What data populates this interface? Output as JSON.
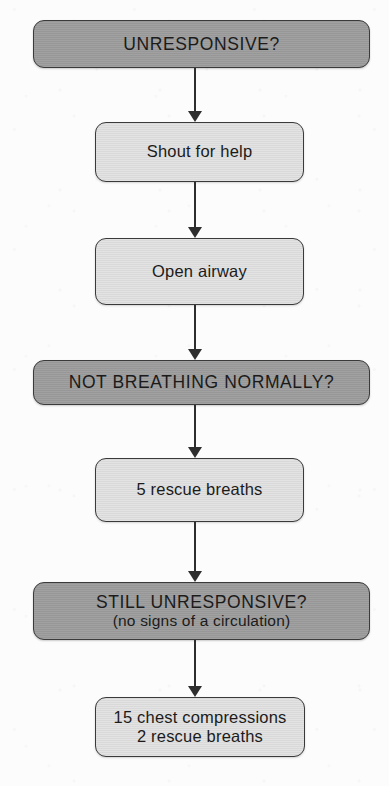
{
  "diagram": {
    "colors": {
      "page_background": "#fcfcfc",
      "dark_node_fill": "#9c9c9c",
      "light_node_fill": "#dddddd",
      "node_border": "#3a3a3a",
      "arrow": "#2e2e2e",
      "text": "#1b1b1b"
    },
    "nodes": [
      {
        "id": "unresponsive",
        "style": "dark",
        "text_style": "caps",
        "line_1": "UNRESPONSIVE?",
        "line_2": ""
      },
      {
        "id": "shout-for-help",
        "style": "light",
        "text_style": "body",
        "line_1": "Shout for help",
        "line_2": ""
      },
      {
        "id": "open-airway",
        "style": "light",
        "text_style": "body",
        "line_1": "Open airway",
        "line_2": ""
      },
      {
        "id": "not-breathing-normally",
        "style": "dark",
        "text_style": "caps",
        "line_1": "NOT BREATHING NORMALLY?",
        "line_2": ""
      },
      {
        "id": "five-rescue-breaths",
        "style": "light",
        "text_style": "body",
        "line_1": "5 rescue breaths",
        "line_2": ""
      },
      {
        "id": "still-unresponsive",
        "style": "dark",
        "text_style": "caps",
        "line_1": "STILL UNRESPONSIVE?",
        "line_2": "(no signs of a circulation)"
      },
      {
        "id": "compressions-and-breaths",
        "style": "light",
        "text_style": "body",
        "line_1": "15 chest compressions",
        "line_2": "2 rescue breaths"
      }
    ],
    "connectors": [
      {
        "from": "unresponsive",
        "to": "shout-for-help"
      },
      {
        "from": "shout-for-help",
        "to": "open-airway"
      },
      {
        "from": "open-airway",
        "to": "not-breathing-normally"
      },
      {
        "from": "not-breathing-normally",
        "to": "five-rescue-breaths"
      },
      {
        "from": "five-rescue-breaths",
        "to": "still-unresponsive"
      },
      {
        "from": "still-unresponsive",
        "to": "compressions-and-breaths"
      }
    ]
  }
}
